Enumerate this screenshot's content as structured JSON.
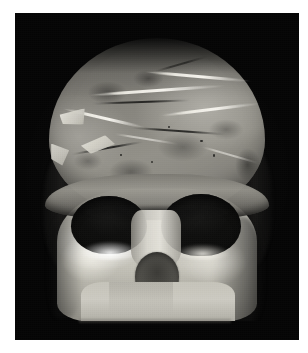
{
  "page": {
    "background_color": "#ffffff",
    "width": 308,
    "height": 353
  },
  "photo": {
    "alt_text": "Frontal view of a reconstructed fossil hominin skull on a black background",
    "background_color": "#050505",
    "left": 15,
    "top": 13,
    "width": 284,
    "height": 327,
    "orientation": "portrait",
    "subject": "skull",
    "view": "frontal"
  },
  "skull": {
    "name": "reconstructed-hominin-skull",
    "bone_light_color": "#cac8bf",
    "bone_mid_color": "#85837c",
    "bone_dark_color": "#3a3935",
    "plaster_fill_color": "#e8e6dd",
    "socket_color": "#0b0b0a",
    "parts": {
      "cranial_vault": "cranial vault",
      "brow_ridge": "supraorbital torus",
      "orbit_left": "left eye orbit",
      "orbit_right": "right eye orbit",
      "nasal_bridge": "nasal bridge",
      "nasal_aperture": "nasal aperture",
      "maxilla": "maxilla",
      "cheek_left": "left zygomatic",
      "cheek_right": "right zygomatic",
      "temporal_left": "left temporal edge",
      "temporal_right": "right temporal edge"
    }
  }
}
